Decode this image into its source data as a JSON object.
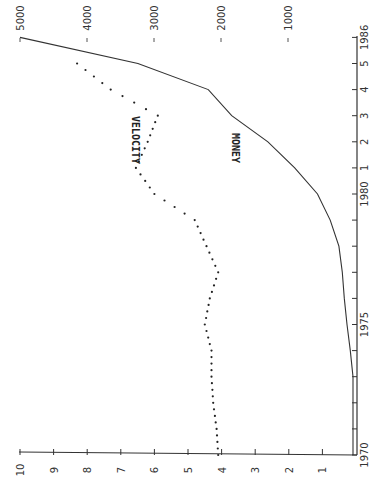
{
  "chart_data": {
    "type": "line",
    "orientation": "rotated-90",
    "title": "",
    "x": [
      1970,
      1971,
      1972,
      1973,
      1974,
      1975,
      1976,
      1977,
      1978,
      1979,
      1980,
      1981,
      1982,
      1983,
      1984,
      1985,
      1986
    ],
    "x_tick_labels": [
      "1970",
      "",
      "",
      "",
      "",
      "1975",
      "",
      "",
      "",
      "",
      "1980",
      "1",
      "2",
      "3",
      "4",
      "5",
      "1986"
    ],
    "series": [
      {
        "name": "MONEY",
        "style": "solid",
        "axis": "right",
        "values": [
          30,
          30,
          30,
          30,
          70,
          120,
          160,
          190,
          240,
          370,
          560,
          900,
          1300,
          1840,
          2190,
          3240,
          5000
        ]
      },
      {
        "name": "VELOCITY",
        "style": "dotted",
        "axis": "left",
        "values": [
          4.1,
          4.15,
          4.25,
          4.3,
          4.3,
          4.5,
          4.35,
          4.1,
          4.45,
          4.8,
          6.0,
          6.55,
          6.2,
          5.9,
          7.3,
          8.3,
          null
        ]
      }
    ],
    "left_axis": {
      "label": "",
      "ticks": [
        "1",
        "2",
        "3",
        "4",
        "5",
        "6",
        "7",
        "8",
        "9",
        "10"
      ],
      "ylim": [
        0,
        10
      ]
    },
    "right_axis": {
      "label": "",
      "ticks": [
        "1000",
        "2000",
        "3000",
        "4000",
        "5000"
      ],
      "ylim": [
        0,
        5000
      ]
    },
    "annotations": [
      "VELOCITY",
      "MONEY"
    ],
    "grid": false,
    "legend": "none (inline labels)"
  }
}
